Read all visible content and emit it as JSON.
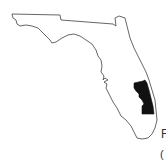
{
  "map": {
    "region": "Florida",
    "highlighted_area": "east-central/southeast coast counties",
    "colors": {
      "outline": "#555555",
      "land": "#ffffff",
      "highlight": "#111111",
      "background": "#ffffff"
    }
  },
  "captions": {
    "fragment_1": "F",
    "fragment_2": "("
  }
}
